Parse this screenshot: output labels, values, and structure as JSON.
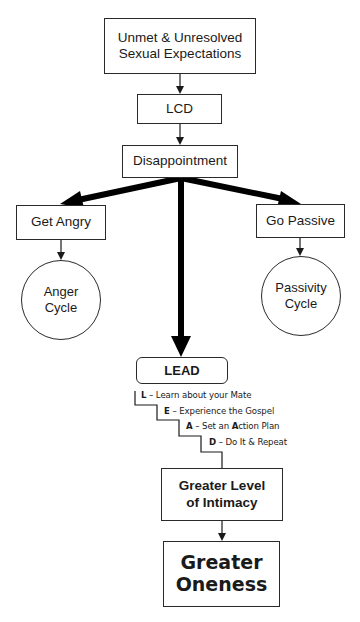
{
  "diagram": {
    "nodes": {
      "unmet": {
        "line1": "Unmet & Unresolved",
        "line2": "Sexual Expectations"
      },
      "lcd": {
        "label": "LCD"
      },
      "disappointment": {
        "label": "Disappointment"
      },
      "get_angry": {
        "label": "Get Angry"
      },
      "go_passive": {
        "label": "Go Passive"
      },
      "anger_cycle": {
        "line1": "Anger",
        "line2": "Cycle"
      },
      "passivity_cycle": {
        "line1": "Passivity",
        "line2": "Cycle"
      },
      "lead": {
        "label": "LEAD"
      },
      "intimacy": {
        "line1": "Greater Level",
        "line2": "of Intimacy"
      },
      "oneness": {
        "line1": "Greater",
        "line2": "Oneness"
      }
    },
    "lead_steps": [
      {
        "key": "L",
        "dash": " – ",
        "text": "Learn about your Mate"
      },
      {
        "key": "E",
        "dash": " – ",
        "text": "Experience the Gospel"
      },
      {
        "key": "A",
        "dash": " – ",
        "text_before": "Set an ",
        "bold_letter": "A",
        "text_after": "ction Plan"
      },
      {
        "key": "D",
        "dash": " – ",
        "text": "Do It & Repeat"
      }
    ],
    "edges": [
      {
        "from": "unmet",
        "to": "lcd",
        "style": "thin"
      },
      {
        "from": "lcd",
        "to": "disappointment",
        "style": "thin"
      },
      {
        "from": "disappointment",
        "to": "get_angry",
        "style": "thick"
      },
      {
        "from": "disappointment",
        "to": "go_passive",
        "style": "thick"
      },
      {
        "from": "disappointment",
        "to": "lead",
        "style": "thick"
      },
      {
        "from": "get_angry",
        "to": "anger_cycle",
        "style": "thin"
      },
      {
        "from": "go_passive",
        "to": "passivity_cycle",
        "style": "thin"
      },
      {
        "from": "lead",
        "to": "intimacy",
        "style": "staircase"
      },
      {
        "from": "intimacy",
        "to": "oneness",
        "style": "thin"
      }
    ],
    "colors": {
      "stroke": "#1a1a1a",
      "background": "#ffffff"
    }
  }
}
